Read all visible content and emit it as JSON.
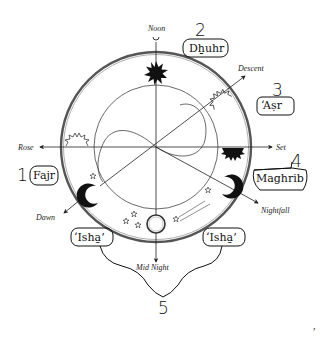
{
  "diagram": {
    "directions": {
      "noon": "Noon",
      "descent": "Descent",
      "rose": "Rose",
      "set": "Set",
      "dawn": "Dawn",
      "nightfall": "Nightfall",
      "mid_night": "Mid Night"
    },
    "prayers": [
      {
        "number": "1",
        "name": "Fajr"
      },
      {
        "number": "2",
        "name": "Dhuhr"
      },
      {
        "number": "3",
        "name": "‘Aṣr"
      },
      {
        "number": "4",
        "name": "Maghrib"
      },
      {
        "number": "5",
        "name": "‘Ishā’"
      }
    ],
    "isha_left": "‘Isha̱’",
    "isha_right": "‘Isha̱’",
    "dhuhr_display": "Dẖuhr",
    "maghrib_display": "Maghrib",
    "stray_mark": ","
  }
}
